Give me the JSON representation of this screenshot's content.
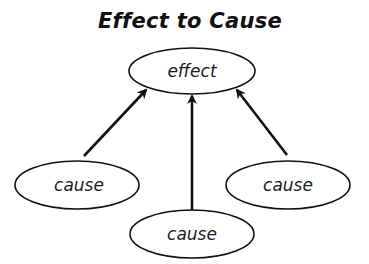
{
  "title": "Effect to Cause",
  "colors": {
    "stroke": "#111111",
    "background": "#ffffff",
    "text": "#1a1a1a"
  },
  "nodes": {
    "effect": {
      "label": "effect",
      "cx": 192,
      "cy": 71,
      "rx": 63,
      "ry": 23
    },
    "cause_left": {
      "label": "cause",
      "cx": 77,
      "cy": 185,
      "rx": 62,
      "ry": 24
    },
    "cause_right": {
      "label": "cause",
      "cx": 288,
      "cy": 185,
      "rx": 62,
      "ry": 24
    },
    "cause_bottom": {
      "label": "cause",
      "cx": 192,
      "cy": 234,
      "rx": 62,
      "ry": 24
    }
  },
  "edges": [
    {
      "from": "cause_left",
      "to": "effect"
    },
    {
      "from": "cause_bottom",
      "to": "effect"
    },
    {
      "from": "cause_right",
      "to": "effect"
    }
  ]
}
